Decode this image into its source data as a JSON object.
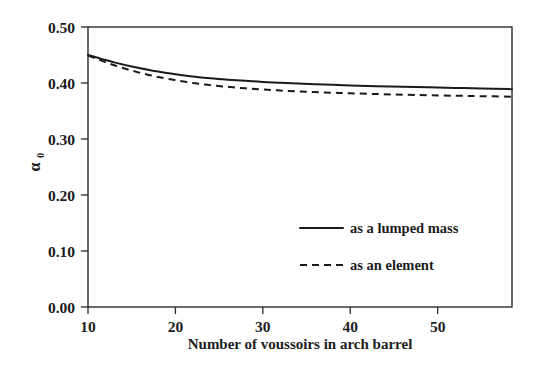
{
  "chart_data": {
    "type": "line",
    "title": "",
    "xlabel": "Number of voussoirs in arch barrel",
    "ylabel": "α₀",
    "ylabel_main": "α",
    "ylabel_subscript": "0",
    "xlim": [
      10,
      58.5
    ],
    "ylim": [
      0.0,
      0.5
    ],
    "xticks": [
      10,
      20,
      30,
      40,
      50
    ],
    "xtick_labels": [
      "10",
      "20",
      "30",
      "40",
      "50"
    ],
    "yticks": [
      0.0,
      0.1,
      0.2,
      0.3,
      0.4,
      0.5
    ],
    "ytick_labels": [
      "0.00",
      "0.10",
      "0.20",
      "0.30",
      "0.40",
      "0.50"
    ],
    "grid": false,
    "legend_position": "center-right-inside",
    "series": [
      {
        "name": "as a lumped mass",
        "style": "solid",
        "color": "#1a1a1a",
        "x": [
          10,
          11,
          12,
          13,
          14,
          15,
          16,
          17,
          18,
          19,
          20,
          22,
          24,
          26,
          28,
          30,
          32,
          34,
          36,
          38,
          40,
          43,
          46,
          49,
          52,
          55,
          58.5
        ],
        "y": [
          0.45,
          0.4455,
          0.441,
          0.4368,
          0.433,
          0.4295,
          0.4262,
          0.4232,
          0.4205,
          0.418,
          0.4158,
          0.4118,
          0.4086,
          0.406,
          0.4038,
          0.402,
          0.4004,
          0.399,
          0.3978,
          0.3967,
          0.3957,
          0.3944,
          0.3932,
          0.3922,
          0.3912,
          0.3902,
          0.389
        ]
      },
      {
        "name": "as an element",
        "style": "dashed",
        "color": "#1a1a1a",
        "x": [
          10,
          11,
          12,
          13,
          14,
          15,
          16,
          17,
          18,
          19,
          20,
          22,
          24,
          26,
          28,
          30,
          32,
          34,
          36,
          38,
          40,
          43,
          46,
          49,
          52,
          55,
          58.5
        ],
        "y": [
          0.449,
          0.443,
          0.4372,
          0.4318,
          0.4268,
          0.4222,
          0.418,
          0.4142,
          0.4108,
          0.4077,
          0.4049,
          0.4001,
          0.3962,
          0.3931,
          0.3905,
          0.3884,
          0.3866,
          0.3851,
          0.3838,
          0.3826,
          0.3816,
          0.3803,
          0.3791,
          0.3782,
          0.3773,
          0.3765,
          0.3756
        ]
      }
    ],
    "legend_entries": [
      {
        "label": "as a lumped mass",
        "style": "solid"
      },
      {
        "label": "as an element",
        "style": "dashed"
      }
    ]
  }
}
